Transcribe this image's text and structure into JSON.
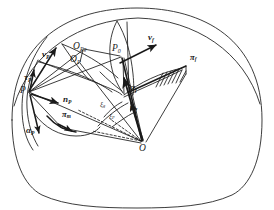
{
  "figure": {
    "type": "geometric-vector-diagram",
    "background_color": "#ffffff",
    "stroke_color": "#1a1a1a",
    "label_color": "#1a1a1a"
  },
  "points": [
    {
      "id": "P",
      "base": "P",
      "sub": "",
      "x": 28,
      "y": 92,
      "label_x": 20,
      "label_y": 91
    },
    {
      "id": "P0",
      "base": "P",
      "sub": "0",
      "x": 122,
      "y": 53,
      "label_x": 112,
      "label_y": 49
    },
    {
      "id": "O",
      "base": "O",
      "sub": "",
      "x": 143,
      "y": 143,
      "label_x": 139,
      "label_y": 149
    },
    {
      "id": "OP",
      "base": "O",
      "sub": "P",
      "x": 79,
      "y": 62,
      "label_x": 70,
      "label_y": 60
    },
    {
      "id": "OPg",
      "base": "O",
      "sub": "Pg",
      "x": 84,
      "y": 49,
      "label_x": 73,
      "label_y": 47
    }
  ],
  "vectors": [
    {
      "id": "vP",
      "base": "v",
      "sub": "P",
      "label_x": 42,
      "label_y": 55,
      "bold": true
    },
    {
      "id": "vf",
      "base": "v",
      "sub": "f",
      "label_x": 148,
      "label_y": 38,
      "bold": true
    },
    {
      "id": "nP",
      "base": "n",
      "sub": "P",
      "label_x": 63,
      "label_y": 100,
      "bold": true
    },
    {
      "id": "nf",
      "base": "n",
      "sub": "f",
      "label_x": 130,
      "label_y": 108,
      "bold": true
    },
    {
      "id": "alphaP",
      "base": "α",
      "sub": "P",
      "label_x": 26,
      "label_y": 131,
      "bold": true
    },
    {
      "id": "alphaf",
      "base": "α",
      "sub": "f",
      "label_x": 130,
      "label_y": 88,
      "bold": true
    },
    {
      "id": "tauP",
      "base": "τ",
      "sub": "P",
      "label_x": 24,
      "label_y": 79,
      "bold": true
    }
  ],
  "planes": [
    {
      "id": "pif",
      "base": "π",
      "sub": "f",
      "label_x": 190,
      "label_y": 58,
      "bold": true
    },
    {
      "id": "pim",
      "base": "π",
      "sub": "m",
      "label_x": 62,
      "label_y": 115,
      "bold": true
    }
  ],
  "angles": [
    {
      "id": "xi_g",
      "base": "ξ",
      "sub": "g",
      "label_x": 100,
      "label_y": 105
    },
    {
      "id": "xi_P",
      "base": "ξ",
      "sub": "P",
      "label_x": 109,
      "label_y": 117
    }
  ],
  "hatching": {
    "name": "plane-hatching",
    "count": 7,
    "anchor_x": 182,
    "anchor_y": 64
  }
}
